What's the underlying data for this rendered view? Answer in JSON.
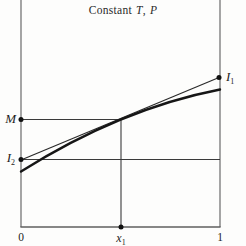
{
  "title": {
    "constant": "Constant",
    "T": "T",
    "comma": ",",
    "P": "P"
  },
  "labels": {
    "M": "M",
    "I1": {
      "main": "I",
      "sub": "1"
    },
    "I2": {
      "main": "I",
      "sub": "2"
    },
    "x_axis": {
      "zero": "0",
      "x1_main": "x",
      "x1_sub": "1",
      "one": "1"
    }
  },
  "colors": {
    "background": "#fdfdfc",
    "axis": "#6a6a6a",
    "construction_line": "#3a3a3a",
    "tangent_line": "#2a2a2a",
    "curve": "#161616",
    "dot": "#111111"
  },
  "figure": {
    "width": 246,
    "height": 246,
    "lines": [
      {
        "name": "left-axis",
        "x1": 21,
        "y1": 0,
        "x2": 21,
        "y2": 227,
        "w": 1.2,
        "color": "#6a6a6a"
      },
      {
        "name": "right-axis",
        "x1": 220,
        "y1": 0,
        "x2": 220,
        "y2": 227,
        "w": 1.2,
        "color": "#6a6a6a"
      },
      {
        "name": "bottom-axis",
        "x1": 20.4,
        "y1": 227,
        "x2": 220.6,
        "y2": 227,
        "w": 1.6,
        "color": "#5f5f5f"
      },
      {
        "name": "m-horizontal-line",
        "x1": 21,
        "y1": 119.5,
        "x2": 121,
        "y2": 119.5,
        "w": 1.1,
        "color": "#3a3a3a"
      },
      {
        "name": "x1-vertical-line",
        "x1": 121,
        "y1": 119.5,
        "x2": 121,
        "y2": 227,
        "w": 1.1,
        "color": "#3a3a3a"
      },
      {
        "name": "i2-horizontal-line",
        "x1": 21,
        "y1": 159.5,
        "x2": 220,
        "y2": 159.5,
        "w": 1.1,
        "color": "#3a3a3a"
      },
      {
        "name": "tangent-line",
        "x1": 21,
        "y1": 160,
        "x2": 219,
        "y2": 77.5,
        "w": 1.2,
        "color": "#2a2a2a"
      }
    ],
    "curve": {
      "p0": [
        21,
        171.5
      ],
      "c": [
        120.5,
        108.8
      ],
      "p2": [
        220,
        89.5
      ],
      "w": 2.4,
      "color": "#161616"
    },
    "dots": [
      {
        "name": "m-point",
        "x": 21,
        "y": 119.5,
        "r": 2.5
      },
      {
        "name": "i2-intercept-point",
        "x": 21,
        "y": 159.5,
        "r": 2.5
      },
      {
        "name": "i1-intercept-point",
        "x": 219,
        "y": 77.5,
        "r": 2.5
      },
      {
        "name": "x1-axis-point",
        "x": 121,
        "y": 227,
        "r": 2.5
      }
    ],
    "dot_color": "#111111"
  }
}
